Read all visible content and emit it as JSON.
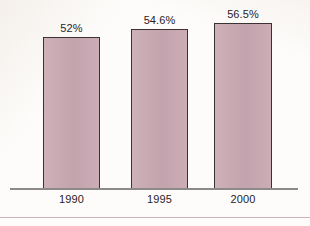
{
  "chart_data": {
    "type": "bar",
    "title": "",
    "subtitle": "",
    "xlabel": "",
    "ylabel": "",
    "categories": [
      "1990",
      "1995",
      "2000"
    ],
    "values": [
      52,
      54.6,
      56.5
    ],
    "value_labels": [
      "52%",
      "54.6%",
      "56.5%"
    ],
    "ylim": [
      0,
      65
    ],
    "grid": false,
    "legend": null,
    "series": [
      {
        "name": "",
        "values": [
          52,
          54.6,
          56.5
        ]
      }
    ],
    "bar_color": "#c9a8b2",
    "bar_border_color": "#3c3134",
    "axis_color": "#8d8a8b",
    "text_color": "#2a2326",
    "background_color": "#fdfcfa",
    "rule_color": "#cdb3ba"
  }
}
